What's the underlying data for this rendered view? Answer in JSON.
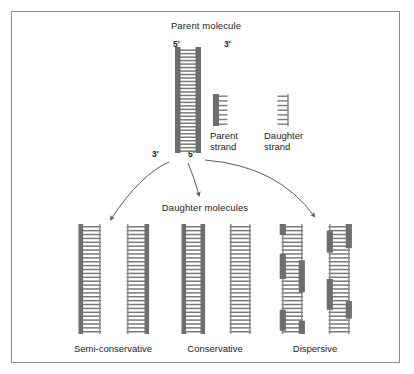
{
  "figure": {
    "title": "Parent molecule",
    "daughter_title": "Daughter molecules",
    "border_color": "#8d8d8d",
    "background": "#ffffff",
    "parent_strand_color": "#6e6e6e",
    "daughter_strand_color": "#8a8a8a",
    "rung_color": "#7a7a7a",
    "arrow_color": "#5c5c5c"
  },
  "parent_molecule": {
    "label": "Parent molecule",
    "end_labels": {
      "top_left": "5'",
      "top_right": "3'",
      "bottom_left": "3'",
      "bottom_right": "5'"
    },
    "rungs": 30,
    "left_strand": "parent",
    "right_strand": "parent"
  },
  "legend": {
    "items": [
      {
        "icon": "parent-strand-icon",
        "line1": "Parent",
        "line2": "strand",
        "type": "parent"
      },
      {
        "icon": "daughter-strand-icon",
        "line1": "Daughter",
        "line2": "strand",
        "type": "daughter"
      }
    ]
  },
  "models": [
    {
      "id": "semi-conservative",
      "label": "Semi-conservative",
      "molecules": [
        {
          "left": "parent",
          "right": "daughter"
        },
        {
          "left": "daughter",
          "right": "parent"
        }
      ]
    },
    {
      "id": "conservative",
      "label": "Conservative",
      "molecules": [
        {
          "left": "parent",
          "right": "parent"
        },
        {
          "left": "daughter",
          "right": "daughter"
        }
      ]
    },
    {
      "id": "dispersive",
      "label": "Dispersive",
      "molecules": [
        {
          "left": "mixed",
          "right": "mixed",
          "left_segments": [
            [
              0.0,
              0.1
            ],
            [
              0.27,
              0.5
            ],
            [
              0.78,
              0.97
            ]
          ],
          "right_segments": [
            [
              0.33,
              0.62
            ],
            [
              0.88,
              1.0
            ]
          ]
        },
        {
          "left": "mixed",
          "right": "mixed",
          "left_segments": [
            [
              0.06,
              0.26
            ],
            [
              0.5,
              0.78
            ]
          ],
          "right_segments": [
            [
              0.0,
              0.22
            ],
            [
              0.7,
              0.86
            ]
          ]
        }
      ]
    }
  ],
  "arrows": {
    "count": 3,
    "targets": [
      "semi-conservative",
      "conservative",
      "dispersive"
    ]
  }
}
